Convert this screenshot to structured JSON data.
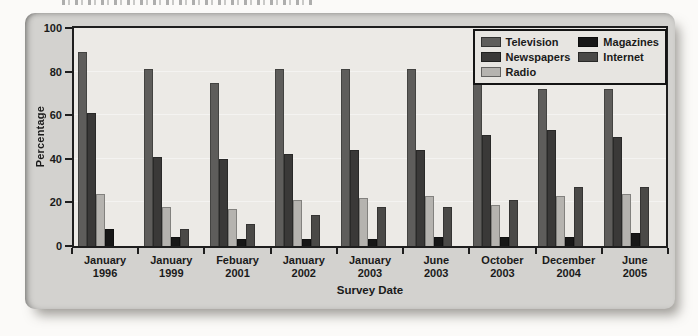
{
  "chart_data": {
    "type": "bar",
    "title": "",
    "xlabel": "Survey Date",
    "ylabel": "Percentage",
    "ylim": [
      0,
      100
    ],
    "yticks": [
      0,
      20,
      40,
      60,
      80,
      100
    ],
    "grid": false,
    "legend_position": "top-right",
    "legend_columns": 2,
    "categories": [
      "January\n1996",
      "January\n1999",
      "Febuary\n2001",
      "January\n2002",
      "January\n2003",
      "June\n2003",
      "October\n2003",
      "December\n2004",
      "June\n2005"
    ],
    "series": [
      {
        "name": "Television",
        "color": "#5e5d5b",
        "values": [
          89,
          81,
          75,
          81,
          81,
          81,
          80,
          72,
          72
        ]
      },
      {
        "name": "Newspapers",
        "color": "#3a3938",
        "values": [
          61,
          41,
          40,
          42,
          44,
          44,
          51,
          53,
          50
        ]
      },
      {
        "name": "Radio",
        "color": "#b5b3af",
        "values": [
          24,
          18,
          17,
          21,
          22,
          23,
          19,
          23,
          24
        ]
      },
      {
        "name": "Magazines",
        "color": "#171717",
        "values": [
          8,
          4,
          3,
          3,
          3,
          4,
          4,
          4,
          6
        ]
      },
      {
        "name": "Internet",
        "color": "#4a4947",
        "values": [
          0,
          8,
          10,
          14,
          18,
          18,
          21,
          27,
          27
        ]
      }
    ]
  }
}
